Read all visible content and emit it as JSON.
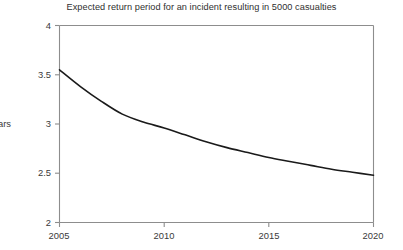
{
  "chart_data": {
    "type": "line",
    "title": "Expected return period for an incident resulting in 5000 casualties",
    "xlabel": "",
    "ylabel": "Years",
    "xlim": [
      2005,
      2020
    ],
    "ylim": [
      2,
      4
    ],
    "grid": false,
    "legend": "none",
    "xticks": [
      "2005",
      "2010",
      "2015",
      "2020"
    ],
    "yticks": [
      "2",
      "2.5",
      "3",
      "3.5",
      "4"
    ],
    "x": [
      2005,
      2006,
      2007,
      2008,
      2009,
      2010,
      2011,
      2012,
      2013,
      2014,
      2015,
      2016,
      2017,
      2018,
      2019,
      2020
    ],
    "series": [
      {
        "name": "Expected return period",
        "values": [
          3.55,
          3.38,
          3.23,
          3.1,
          3.02,
          2.96,
          2.89,
          2.82,
          2.76,
          2.71,
          2.66,
          2.62,
          2.58,
          2.54,
          2.51,
          2.48
        ]
      }
    ],
    "line_color": "#1a1a1a",
    "axis_color": "#8d8d8d"
  },
  "axes": {
    "y_title": "Years",
    "y_tick_labels": [
      "4",
      "3.5",
      "3",
      "2.5",
      "2"
    ],
    "x_tick_labels": [
      "2005",
      "2010",
      "2015",
      "2020"
    ]
  }
}
